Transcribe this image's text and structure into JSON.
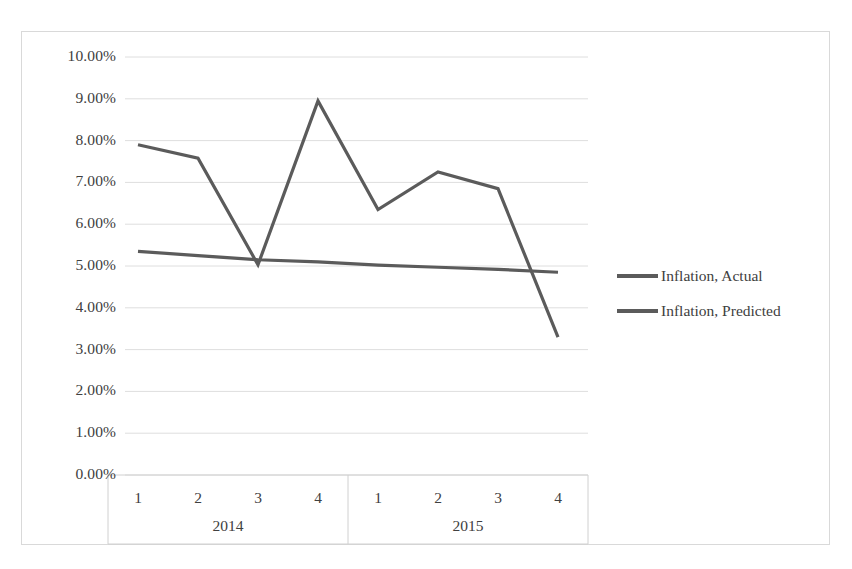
{
  "chart_data": {
    "type": "line",
    "title": "",
    "xlabel": "",
    "ylabel": "",
    "ylim": [
      0,
      10
    ],
    "ytick_values": [
      10,
      9,
      8,
      7,
      6,
      5,
      4,
      3,
      2,
      1,
      0
    ],
    "ytick_labels": [
      "10.00%",
      "9.00%",
      "8.00%",
      "7.00%",
      "6.00%",
      "5.00%",
      "4.00%",
      "3.00%",
      "2.00%",
      "1.00%",
      "0.00%"
    ],
    "grid": true,
    "grid_axis": "y",
    "legend_position": "right",
    "x_groups": [
      {
        "label": "2014",
        "ticks": [
          "1",
          "2",
          "3",
          "4"
        ]
      },
      {
        "label": "2015",
        "ticks": [
          "1",
          "2",
          "3",
          "4"
        ]
      }
    ],
    "categories": [
      "2014 Q1",
      "2014 Q2",
      "2014 Q3",
      "2014 Q4",
      "2015 Q1",
      "2015 Q2",
      "2015 Q3",
      "2015 Q4"
    ],
    "series": [
      {
        "name": "Inflation, Actual",
        "color": "#5b5b5b",
        "values": [
          7.9,
          7.58,
          5.03,
          8.95,
          6.35,
          7.25,
          6.85,
          3.3
        ]
      },
      {
        "name": "Inflation, Predicted",
        "color": "#5b5b5b",
        "values": [
          5.35,
          5.25,
          5.15,
          5.1,
          5.02,
          4.97,
          4.92,
          4.85
        ]
      }
    ]
  },
  "legend": {
    "items": [
      {
        "label": "Inflation, Actual"
      },
      {
        "label": "Inflation, Predicted"
      }
    ]
  },
  "colors": {
    "series_line": "#5b5b5b",
    "gridline": "#dedede",
    "frame_border": "#d9d9d9",
    "axis_line": "#d0d0d0",
    "text": "#404040"
  }
}
